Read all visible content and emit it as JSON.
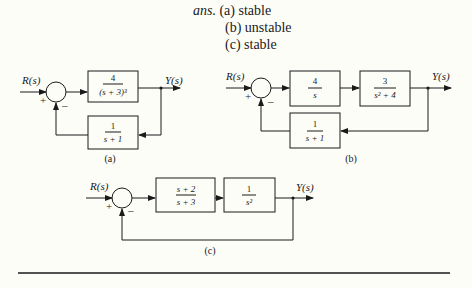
{
  "answer": {
    "prefix": "ans.",
    "items": [
      {
        "label": "(a) stable"
      },
      {
        "label": "(b) unstable"
      },
      {
        "label": "(c) stable"
      }
    ]
  },
  "diagrams": {
    "a": {
      "caption": "(a)",
      "input": "R(s)",
      "output": "Y(s)",
      "plus": "+",
      "minus": "–",
      "forward": [
        {
          "num": "4",
          "den": "(s + 3)³"
        }
      ],
      "feedback": {
        "num": "1",
        "den": "s + 1"
      }
    },
    "b": {
      "caption": "(b)",
      "input": "R(s)",
      "output": "Y(s)",
      "plus": "+",
      "minus": "–",
      "forward": [
        {
          "num": "4",
          "den": "s"
        },
        {
          "num": "3",
          "den": "s² + 4"
        }
      ],
      "feedback": {
        "num": "1",
        "den": "s + 1"
      }
    },
    "c": {
      "caption": "(c)",
      "input": "R(s)",
      "output": "Y(s)",
      "plus": "+",
      "minus": "–",
      "forward": [
        {
          "num": "s + 2",
          "den": "s + 3"
        },
        {
          "num": "1",
          "den": "s²"
        }
      ],
      "feedback": null
    }
  }
}
